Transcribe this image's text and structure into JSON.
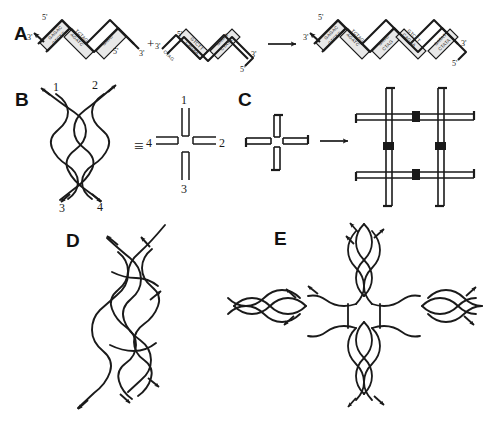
{
  "figure": {
    "caption_title": "DNA branched junction assembly",
    "background_color": "#ffffff",
    "ink_color": "#1a1a1a",
    "duplex_fill": "#e8e8e8"
  },
  "panels": [
    {
      "id": "A",
      "letter": "A",
      "description": "Sticky-ended cohesion and ligation of two DNA duplexes into a longer duplex",
      "operator_plus": "+",
      "operator_arrow": "→",
      "reactant_1": {
        "end_labels": [
          "3'",
          "5'",
          "5'",
          "3'"
        ],
        "blocks": [
          {
            "top": "GAGAC",
            "bottom": "CTCTG"
          },
          {
            "top": "AGATC",
            "bottom": "TCTAG"
          },
          {
            "top": "GATC",
            "bottom": ""
          }
        ],
        "sticky_end": "GATC"
      },
      "reactant_2": {
        "end_labels": [
          "3'",
          "5'",
          "3'",
          "5'"
        ],
        "blocks": [
          {
            "top": "CTAG",
            "bottom": ""
          },
          {
            "top": "CAGAA",
            "bottom": "GTCTT"
          },
          {
            "top": "GATAT",
            "bottom": "CTATA"
          }
        ],
        "sticky_end": "CTAG"
      },
      "product": {
        "end_labels": [
          "3'",
          "5'",
          "3'",
          "5'"
        ],
        "blocks": [
          {
            "top": "GAGAC",
            "bottom": "CTCTG"
          },
          {
            "top": "AGATC",
            "bottom": "TCTAG"
          },
          {
            "top": "GATC",
            "bottom": "CTAG"
          },
          {
            "top": "CAGAA",
            "bottom": "GTCTT"
          },
          {
            "top": "GATAT",
            "bottom": "CTATA"
          }
        ]
      }
    },
    {
      "id": "B",
      "letter": "B",
      "description": "Immobile four-arm branched (Holliday) junction and its schematic cross equivalent",
      "equivalence_symbol": "≡",
      "arm_labels": {
        "top_left": "1",
        "top_right": "2",
        "bottom_left": "3",
        "bottom_right": "4"
      },
      "schematic_labels": {
        "top": "1",
        "right": "2",
        "bottom": "3",
        "left": "4"
      },
      "strand_count": 4
    },
    {
      "id": "C",
      "letter": "C",
      "description": "Four-arm junction bearing sticky ends self-assembles into a two-dimensional lattice",
      "operator_arrow": "→",
      "monomer": {
        "arms": 4,
        "sticky_ends": 4
      },
      "lattice": {
        "rows": 2,
        "cols": 2,
        "junction_blocks": 4
      }
    },
    {
      "id": "D",
      "letter": "D",
      "description": "Double crossover (DX) molecule with two helical domains joined at two crossover points",
      "crossover_points": 2,
      "strand_count": 5
    },
    {
      "id": "E",
      "letter": "E",
      "description": "Four-by-four (4x4) cross tile motif with four arms radiating from a central cavity",
      "arms": 4
    }
  ]
}
